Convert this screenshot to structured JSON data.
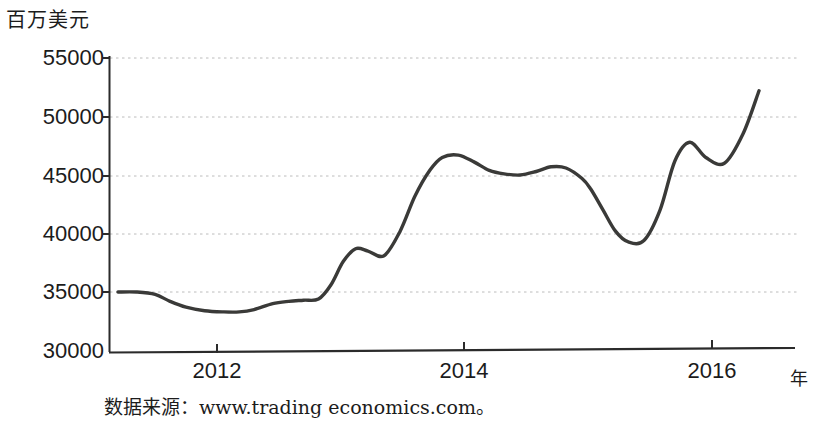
{
  "axis": {
    "y_unit_label": "百万美元",
    "x_unit_label": "年",
    "y_ticks": [
      "55000",
      "50000",
      "45000",
      "40000",
      "35000",
      "30000"
    ],
    "x_ticks": [
      "2012",
      "2014",
      "2016"
    ]
  },
  "source_note": "数据来源：www.trading economics.com。",
  "colors": {
    "line": "#3a3a38",
    "axis": "#2b2b2b",
    "grid": "#b9b9b9",
    "text": "#1c1c1c",
    "background": "#ffffff"
  },
  "chart_data": {
    "type": "line",
    "title": "",
    "xlabel": "年",
    "ylabel": "百万美元",
    "ylim": [
      30000,
      55500
    ],
    "xlim": [
      2011.2,
      2016.45
    ],
    "grid": true,
    "grid_style": "dotted-horizontal",
    "legend": "none",
    "yticks": [
      30000,
      35000,
      40000,
      45000,
      50000,
      55000
    ],
    "xticks": [
      2012,
      2014,
      2016
    ],
    "series": [
      {
        "name": "出口额",
        "x": [
          2011.2,
          2011.35,
          2011.5,
          2011.62,
          2011.75,
          2011.9,
          2012.05,
          2012.18,
          2012.3,
          2012.45,
          2012.58,
          2012.7,
          2012.82,
          2012.92,
          2013.02,
          2013.12,
          2013.22,
          2013.35,
          2013.48,
          2013.6,
          2013.72,
          2013.82,
          2013.95,
          2014.08,
          2014.2,
          2014.32,
          2014.45,
          2014.58,
          2014.7,
          2014.82,
          2014.95,
          2015.02,
          2015.12,
          2015.22,
          2015.32,
          2015.45,
          2015.58,
          2015.7,
          2015.82,
          2015.95,
          2016.1,
          2016.25,
          2016.38
        ],
        "values": [
          35000,
          35000,
          34800,
          34200,
          33700,
          33400,
          33300,
          33300,
          33500,
          34000,
          34200,
          34300,
          34400,
          35600,
          37600,
          38700,
          38500,
          38100,
          40200,
          43200,
          45400,
          46500,
          46700,
          46100,
          45400,
          45100,
          45000,
          45300,
          45700,
          45600,
          44700,
          43800,
          42000,
          40200,
          39300,
          39400,
          42000,
          46200,
          47800,
          46500,
          46000,
          48500,
          52200
        ]
      }
    ],
    "annotations": []
  }
}
